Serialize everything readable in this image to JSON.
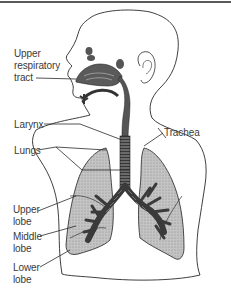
{
  "figure": {
    "labels": {
      "upper_respiratory_tract": [
        "Upper",
        "respiratory",
        "tract"
      ],
      "larynx": "Larynx",
      "trachea": "Trachea",
      "lungs": "Lungs",
      "upper_lobe": [
        "Upper",
        "lobe"
      ],
      "middle_lobe": [
        "Middle",
        "lobe"
      ],
      "lower_lobe": [
        "Lower",
        "lobe"
      ]
    },
    "colors": {
      "background": "#ffffff",
      "outline": "#2a2a2a",
      "lung_fill": "#b8b8b8",
      "airway_fill": "#555555",
      "text": "#3a3a3a"
    }
  }
}
